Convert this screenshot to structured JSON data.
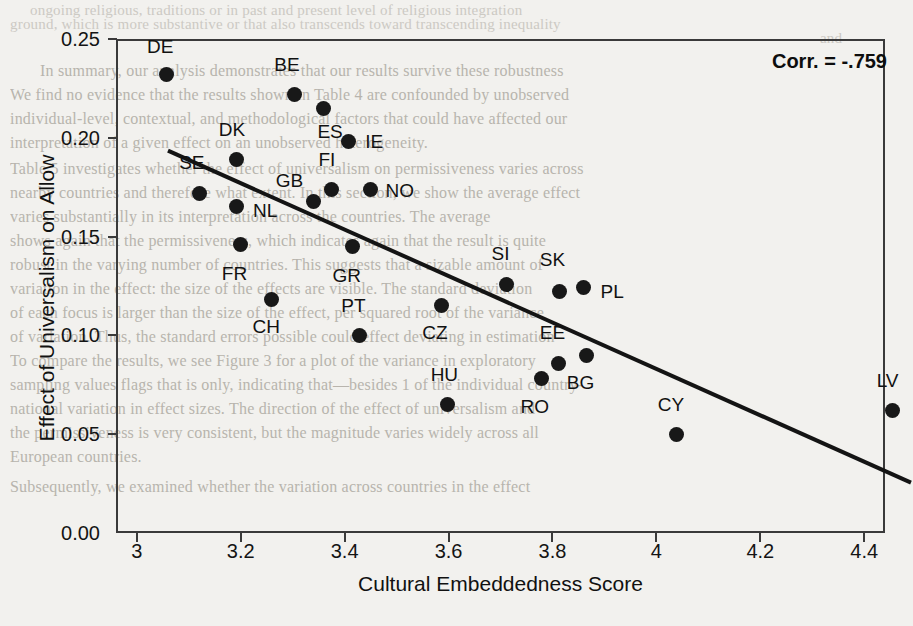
{
  "chart_data": {
    "type": "scatter",
    "title": "",
    "xlabel": "Cultural Embeddedness Score",
    "ylabel": "Effect of Universalism on Allow",
    "annotation": "Corr. = -.759",
    "xlim": [
      2.96,
      4.44
    ],
    "ylim": [
      0.0,
      0.25
    ],
    "xticks": [
      "3",
      "3.2",
      "3.4",
      "3.6",
      "3.8",
      "4",
      "4.2",
      "4.4"
    ],
    "xtick_values": [
      3.0,
      3.2,
      3.4,
      3.6,
      3.8,
      4.0,
      4.2,
      4.4
    ],
    "yticks": [
      "0.00",
      "0.05",
      "0.10",
      "0.15",
      "0.20",
      "0.25"
    ],
    "ytick_values": [
      0.0,
      0.05,
      0.1,
      0.15,
      0.2,
      0.25
    ],
    "grid": false,
    "legend": null,
    "trendline": {
      "x0": 3.06,
      "y0": 0.1935,
      "x1": 4.49,
      "y1": 0.0255
    },
    "points": [
      {
        "label": "DE",
        "x": 3.057,
        "y": 0.232,
        "lx": 3.045,
        "ly": 0.246
      },
      {
        "label": "BE",
        "x": 3.304,
        "y": 0.222,
        "lx": 3.289,
        "ly": 0.237
      },
      {
        "label": "ES",
        "x": 3.36,
        "y": 0.215,
        "lx": 3.372,
        "ly": 0.203
      },
      {
        "label": "IE",
        "x": 3.408,
        "y": 0.198,
        "lx": 3.457,
        "ly": 0.198
      },
      {
        "label": "DK",
        "x": 3.191,
        "y": 0.189,
        "lx": 3.183,
        "ly": 0.204
      },
      {
        "label": "FI",
        "x": 3.374,
        "y": 0.174,
        "lx": 3.366,
        "ly": 0.189
      },
      {
        "label": "NO",
        "x": 3.449,
        "y": 0.174,
        "lx": 3.506,
        "ly": 0.173
      },
      {
        "label": "GB",
        "x": 3.341,
        "y": 0.168,
        "lx": 3.294,
        "ly": 0.178
      },
      {
        "label": "SE",
        "x": 3.121,
        "y": 0.172,
        "lx": 3.106,
        "ly": 0.187
      },
      {
        "label": "NL",
        "x": 3.191,
        "y": 0.165,
        "lx": 3.247,
        "ly": 0.163
      },
      {
        "label": "FR",
        "x": 3.199,
        "y": 0.146,
        "lx": 3.188,
        "ly": 0.131
      },
      {
        "label": "GR",
        "x": 3.415,
        "y": 0.145,
        "lx": 3.404,
        "ly": 0.13
      },
      {
        "label": "CH",
        "x": 3.26,
        "y": 0.118,
        "lx": 3.249,
        "ly": 0.104
      },
      {
        "label": "SI",
        "x": 3.712,
        "y": 0.126,
        "lx": 3.7,
        "ly": 0.141
      },
      {
        "label": "PL",
        "x": 3.86,
        "y": 0.124,
        "lx": 3.915,
        "ly": 0.122
      },
      {
        "label": "SK",
        "x": 3.814,
        "y": 0.122,
        "lx": 3.8,
        "ly": 0.138
      },
      {
        "label": "CZ",
        "x": 3.586,
        "y": 0.115,
        "lx": 3.574,
        "ly": 0.101
      },
      {
        "label": "PT",
        "x": 3.428,
        "y": 0.1,
        "lx": 3.417,
        "ly": 0.115
      },
      {
        "label": "BG",
        "x": 3.866,
        "y": 0.09,
        "lx": 3.854,
        "ly": 0.076
      },
      {
        "label": "EE",
        "x": 3.812,
        "y": 0.086,
        "lx": 3.8,
        "ly": 0.101
      },
      {
        "label": "RO",
        "x": 3.779,
        "y": 0.078,
        "lx": 3.766,
        "ly": 0.064
      },
      {
        "label": "HU",
        "x": 3.598,
        "y": 0.065,
        "lx": 3.592,
        "ly": 0.08
      },
      {
        "label": "CY",
        "x": 4.038,
        "y": 0.05,
        "lx": 4.028,
        "ly": 0.065
      },
      {
        "label": "LV",
        "x": 4.455,
        "y": 0.062,
        "lx": 4.445,
        "ly": 0.077
      }
    ]
  },
  "background_text": {
    "lines": [
      {
        "t": "ongoing religious, traditions or in past and present level of religious integration",
        "x": 30,
        "y": 2,
        "s": 15,
        "strong": false
      },
      {
        "t": "ground, which is more substantive or that also transcends toward transcending inequality",
        "x": 10,
        "y": 16,
        "s": 15,
        "strong": false
      },
      {
        "t": "and",
        "x": 820,
        "y": 30,
        "s": 15,
        "strong": false
      },
      {
        "t": "In summary, our analysis demonstrates that our results survive these robustness",
        "x": 40,
        "y": 62,
        "s": 16,
        "strong": true
      },
      {
        "t": "We find no evidence that the results shown in Table 4 are confounded by unobserved",
        "x": 10,
        "y": 86,
        "s": 16,
        "strong": true
      },
      {
        "t": "individual-level, contextual, and methodological factors that could have affected our",
        "x": 10,
        "y": 110,
        "s": 16,
        "strong": true
      },
      {
        "t": "interpretation of a given effect on an unobserved heterogeneity.",
        "x": 10,
        "y": 134,
        "s": 16,
        "strong": true
      },
      {
        "t": "Table 5 investigates whether the effect of universalism on permissiveness varies across",
        "x": 10,
        "y": 160,
        "s": 16,
        "strong": true
      },
      {
        "t": "nearby countries and therefore what extent. In this section, we show the average effect",
        "x": 10,
        "y": 184,
        "s": 16,
        "strong": true
      },
      {
        "t": "varies substantially in its interpretation across the countries. The average",
        "x": 10,
        "y": 208,
        "s": 16,
        "strong": true
      },
      {
        "t": "shows again that the permissiveness, which indicates again that the result is quite",
        "x": 10,
        "y": 232,
        "s": 16,
        "strong": true
      },
      {
        "t": "robust in the varying number of countries. This suggests that a sizable amount of",
        "x": 10,
        "y": 256,
        "s": 16,
        "strong": true
      },
      {
        "t": "variation in the effect: the size of the effects are visible. The standard deviation",
        "x": 10,
        "y": 280,
        "s": 16,
        "strong": true
      },
      {
        "t": "of each focus is larger than the size of the effect, per squared root of the variance",
        "x": 10,
        "y": 304,
        "s": 16,
        "strong": true
      },
      {
        "t": "of variation. Thus, the standard errors possible could effect deviating in estimation",
        "x": 10,
        "y": 328,
        "s": 16,
        "strong": true
      },
      {
        "t": "To compare the results, we see Figure 3 for a plot of the variance in exploratory",
        "x": 10,
        "y": 352,
        "s": 16,
        "strong": true
      },
      {
        "t": "sampling values flags that is only, indicating that—besides 1 of the individual country-",
        "x": 10,
        "y": 376,
        "s": 16,
        "strong": true
      },
      {
        "t": "national variation in effect sizes. The direction of the effect of universalism and",
        "x": 10,
        "y": 400,
        "s": 16,
        "strong": true
      },
      {
        "t": "the permissiveness is very consistent, but the magnitude varies widely across all",
        "x": 10,
        "y": 424,
        "s": 16,
        "strong": true
      },
      {
        "t": "European countries.",
        "x": 10,
        "y": 448,
        "s": 16,
        "strong": true
      },
      {
        "t": "Subsequently, we examined whether the variation across countries in the effect",
        "x": 10,
        "y": 478,
        "s": 16,
        "strong": true
      }
    ]
  }
}
